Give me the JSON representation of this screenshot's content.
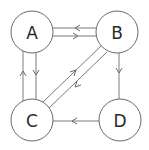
{
  "diagram": {
    "type": "directed-graph",
    "colors": {
      "stroke": "#6a6a6a",
      "edge": "#7a7a7a",
      "label": "#2a2a2a",
      "background": "#ffffff"
    },
    "nodes": [
      {
        "id": "A",
        "label": "A",
        "cx": 32,
        "cy": 32,
        "r": 21
      },
      {
        "id": "B",
        "label": "B",
        "cx": 117,
        "cy": 32,
        "r": 21
      },
      {
        "id": "C",
        "label": "C",
        "cx": 32,
        "cy": 120,
        "r": 21
      },
      {
        "id": "D",
        "label": "D",
        "cx": 120,
        "cy": 120,
        "r": 21
      }
    ],
    "edges": [
      {
        "from": "B",
        "to": "A"
      },
      {
        "from": "A",
        "to": "B"
      },
      {
        "from": "C",
        "to": "A"
      },
      {
        "from": "A",
        "to": "C"
      },
      {
        "from": "C",
        "to": "B"
      },
      {
        "from": "B",
        "to": "C"
      },
      {
        "from": "B",
        "to": "D"
      },
      {
        "from": "D",
        "to": "C"
      }
    ]
  }
}
